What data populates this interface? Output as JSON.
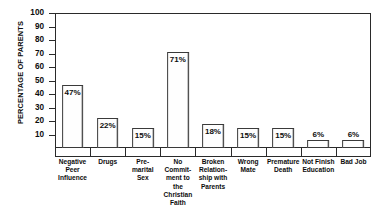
{
  "chart_data": {
    "type": "bar",
    "title": "",
    "xlabel": "",
    "ylabel": "PERCENTAGE OF PARENTS",
    "ylim": [
      0,
      100
    ],
    "ytick_step": 10,
    "yticks": [
      100,
      90,
      80,
      70,
      60,
      50,
      40,
      30,
      20,
      10
    ],
    "grid": false,
    "legend": "none",
    "value_suffix": "%",
    "categories": [
      "Negative Peer Influence",
      "Drugs",
      "Pre-marital Sex",
      "No Commitment to the Christian Faith",
      "Broken Relationship with Parents",
      "Wrong Mate",
      "Premature Death",
      "Not Finish Education",
      "Bad Job"
    ],
    "category_label_lines": [
      [
        "Negative",
        "Peer",
        "Influence"
      ],
      [
        "Drugs"
      ],
      [
        "Pre-",
        "marital",
        "Sex"
      ],
      [
        "No",
        "Commit-",
        "ment to",
        "the",
        "Christian",
        "Faith"
      ],
      [
        "Broken",
        "Relation-",
        "ship with",
        "Parents"
      ],
      [
        "Wrong",
        "Mate"
      ],
      [
        "Premature",
        "Death"
      ],
      [
        "Not Finish",
        "Education"
      ],
      [
        "Bad Job"
      ]
    ],
    "values": [
      47,
      22,
      15,
      71,
      18,
      15,
      15,
      6,
      6
    ],
    "data_labels": [
      "47%",
      "22%",
      "15%",
      "71%",
      "18%",
      "15%",
      "15%",
      "6%",
      "6%"
    ],
    "label_placement": [
      "inside",
      "inside",
      "inside",
      "inside",
      "inside",
      "inside",
      "inside",
      "above",
      "above"
    ]
  },
  "colors": {
    "axis": "#2a2a2a",
    "bar_fill": "#fefefe",
    "bar_edge": "#3a3a3a",
    "text": "#0d0d0d",
    "background": "#ffffff"
  }
}
